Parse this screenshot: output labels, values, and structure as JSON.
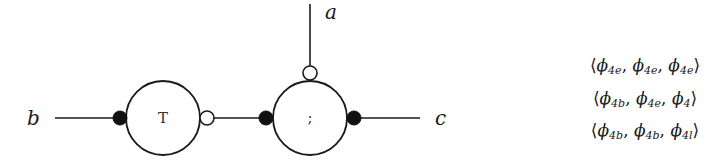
{
  "diagram": {
    "type": "port-graph",
    "colors": {
      "stroke": "#1a1a1a",
      "filled_port": "#111111",
      "open_port": "#ffffff",
      "background": "#ffffff"
    },
    "external_labels": {
      "a": "a",
      "b": "b",
      "c": "c"
    },
    "nodes": [
      {
        "id": "T",
        "label": "T",
        "cx": 163,
        "cy": 118,
        "r": 37
      },
      {
        "id": "seq",
        "label": ";",
        "cx": 310,
        "cy": 118,
        "r": 37
      }
    ],
    "ports": [
      {
        "node": "T",
        "side": "left",
        "kind": "filled"
      },
      {
        "node": "T",
        "side": "right",
        "kind": "open"
      },
      {
        "node": "seq",
        "side": "left",
        "kind": "filled"
      },
      {
        "node": "seq",
        "side": "top",
        "kind": "open"
      },
      {
        "node": "seq",
        "side": "right",
        "kind": "filled"
      }
    ],
    "edges": [
      {
        "from": "b",
        "to": "T.left"
      },
      {
        "from": "T.right",
        "to": "seq.left"
      },
      {
        "from": "seq.top",
        "to": "a"
      },
      {
        "from": "seq.right",
        "to": "c"
      }
    ]
  },
  "tuples": [
    {
      "open": "⟨",
      "items": [
        {
          "sym": "ϕ",
          "sub": "4e"
        },
        {
          "sym": "ϕ",
          "sub": "4e"
        },
        {
          "sym": "ϕ",
          "sub": "4e"
        }
      ],
      "close": "⟩"
    },
    {
      "open": "⟨",
      "items": [
        {
          "sym": "ϕ",
          "sub": "4b"
        },
        {
          "sym": "ϕ",
          "sub": "4e"
        },
        {
          "sym": "ϕ",
          "sub": "4"
        }
      ],
      "close": "⟩"
    },
    {
      "open": "⟨",
      "items": [
        {
          "sym": "ϕ",
          "sub": "4b"
        },
        {
          "sym": "ϕ",
          "sub": "4b"
        },
        {
          "sym": "ϕ",
          "sub": "4l"
        }
      ],
      "close": "⟩"
    }
  ],
  "sep": ", "
}
